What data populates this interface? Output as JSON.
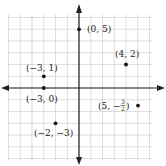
{
  "plane": {
    "origin_px": [
      79,
      88
    ],
    "unit_px": 11.75,
    "x_range": [
      -6,
      6
    ],
    "y_range": [
      -6,
      6
    ],
    "grid_color": "#cfcfcf",
    "axis_color": "#222222"
  },
  "points": [
    {
      "x": 0,
      "y": 5,
      "label": "(0, 5)"
    },
    {
      "x": 4,
      "y": 2,
      "label": "(4, 2)"
    },
    {
      "x": -3,
      "y": 1,
      "label": "(−3, 1)"
    },
    {
      "x": -3,
      "y": 0,
      "label": "(−3, 0)"
    },
    {
      "x": 5,
      "y": -1.5,
      "label": "(5, −",
      "frac_num": "3",
      "frac_den": "2",
      "label_end": ")"
    },
    {
      "x": -2,
      "y": -3,
      "label": "(−2, −3)"
    }
  ]
}
